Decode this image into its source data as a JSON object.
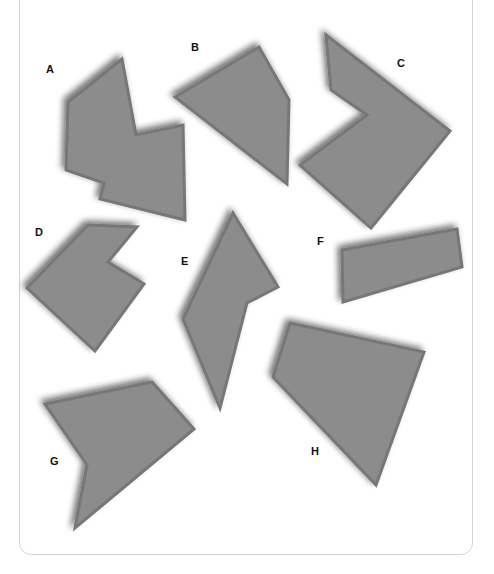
{
  "colors": {
    "shape_fill": "#8c8c8c",
    "shape_edge": "#777777",
    "shadow": "#6a6a6a",
    "label": "#111111",
    "frame_border": "#d4d4d4",
    "background": "#ffffff"
  },
  "shapes": [
    {
      "label": "A",
      "label_pos": [
        46,
        64
      ],
      "points": "122,59 68,102 66,170 104,183 100,199 185,220 183,125 136,135"
    },
    {
      "label": "B",
      "label_pos": [
        191,
        42
      ],
      "points": "175,97 259,47 289,100 287,184"
    },
    {
      "label": "C",
      "label_pos": [
        397,
        58
      ],
      "points": "326,35 450,131 371,228 300,165 367,115 331,90"
    },
    {
      "label": "D",
      "label_pos": [
        35,
        227
      ],
      "points": "88,225 137,227 108,262 144,284 95,351 27,288"
    },
    {
      "label": "E",
      "label_pos": [
        181,
        256
      ],
      "points": "233,213 278,287 247,303 220,408 183,319"
    },
    {
      "label": "F",
      "label_pos": [
        317,
        236
      ],
      "points": "342,250 457,229 462,267 343,302"
    },
    {
      "label": "H",
      "label_pos": [
        311,
        446
      ],
      "points": "290,323 424,352 376,485 273,377"
    },
    {
      "label": "G",
      "label_pos": [
        50,
        456
      ],
      "points": "45,404 152,382 194,429 75,528 87,465"
    }
  ]
}
